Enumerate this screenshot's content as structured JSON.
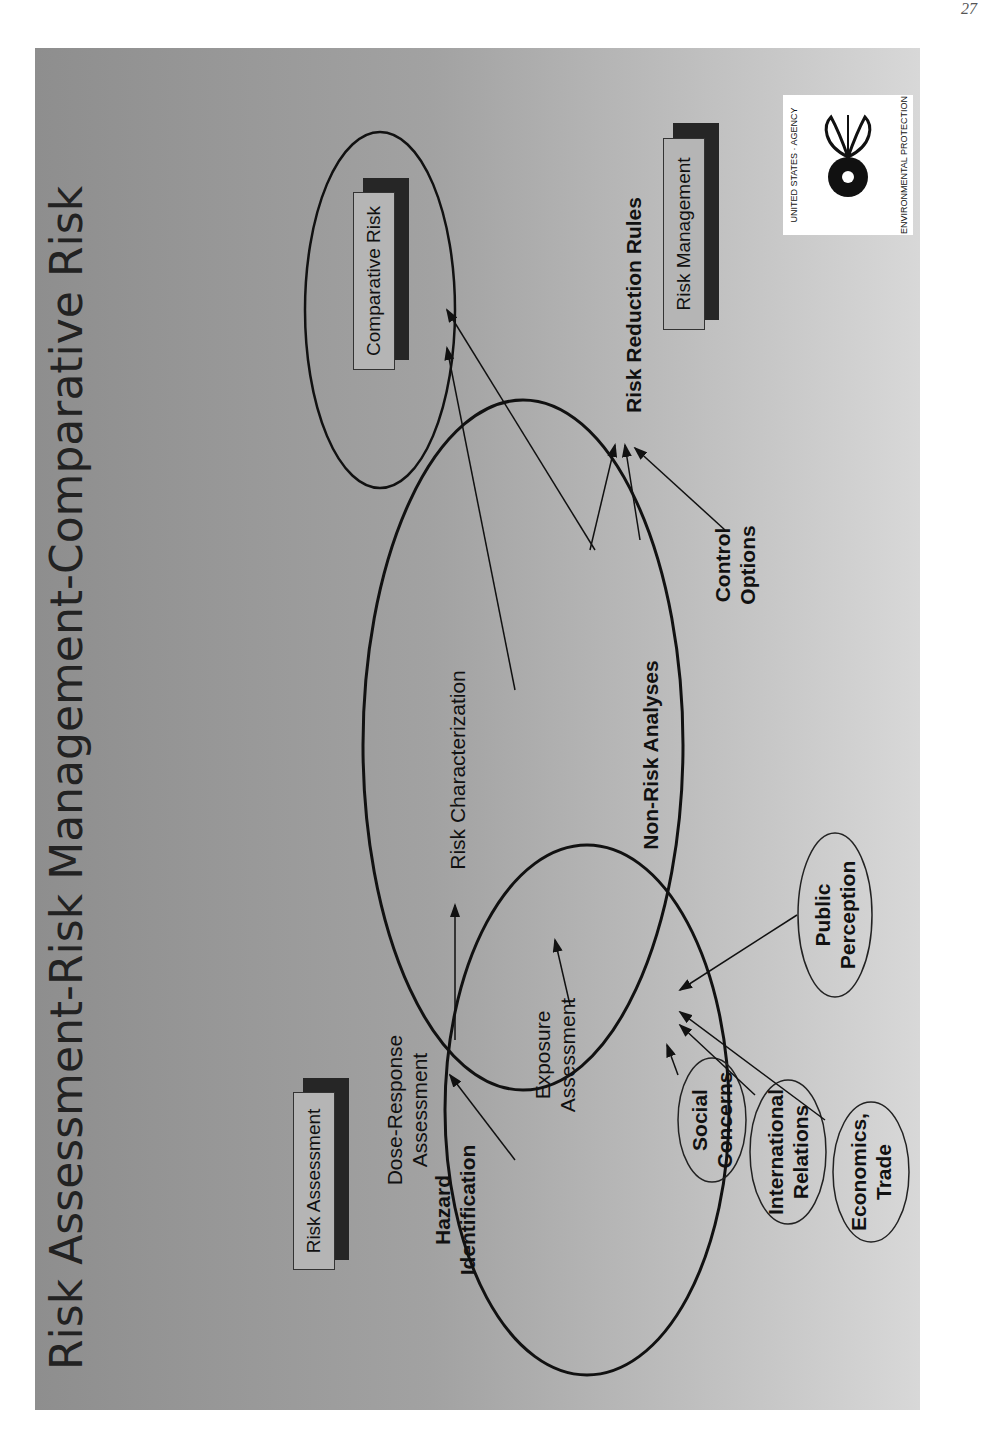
{
  "page_number": "27",
  "slide": {
    "title": "Risk Assessment-Risk Management-Comparative Risk",
    "logo": {
      "name": "epa-seal",
      "text_top": "UNITED STATES · ENVIRONMENTAL PROTECTION AGENCY"
    },
    "boxes": {
      "risk_assessment": "Risk Assessment",
      "comparative_risk": "Comparative Risk",
      "risk_management": "Risk Management"
    },
    "nodes": {
      "hazard_identification": [
        "Hazard",
        "Identification"
      ],
      "dose_response": [
        "Dose-Response",
        "Assessment"
      ],
      "exposure": [
        "Exposure",
        "Assessment"
      ],
      "risk_characterization": "Risk Characterization",
      "non_risk_analyses": "Non-Risk Analyses",
      "control_options": [
        "Control",
        "Options"
      ],
      "risk_reduction_rules": "Risk Reduction Rules"
    },
    "factors": {
      "social": [
        "Social",
        "Concerns"
      ],
      "international": [
        "International",
        "Relations"
      ],
      "economics": [
        "Economics,",
        "Trade"
      ],
      "public": [
        "Public",
        "Perception"
      ]
    },
    "colors": {
      "background_top": "#8e8e8e",
      "background_bottom": "#d8d8d8",
      "box_face": "#b5b5b5",
      "box_shadow": "#262626",
      "ink": "#111111"
    }
  }
}
